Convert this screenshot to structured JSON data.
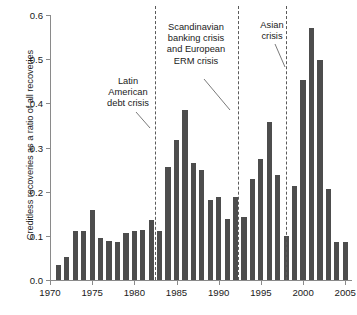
{
  "chart_data": {
    "type": "bar",
    "title": "",
    "xlabel": "",
    "ylabel": "Creditless recoveries as a ratio of all recoveries",
    "xlim": [
      1970,
      2005.8
    ],
    "ylim": [
      0.0,
      0.6
    ],
    "grid": false,
    "legend": null,
    "bar_color": "#4d4d4d",
    "xticks": [
      "1970",
      "1975",
      "1980",
      "1985",
      "1990",
      "1995",
      "2000",
      "2005"
    ],
    "xtick_values": [
      1970,
      1975,
      1980,
      1985,
      1990,
      1995,
      2000,
      2005
    ],
    "yticks": [
      "0.0",
      "0.1",
      "0.2",
      "0.3",
      "0.4",
      "0.5",
      "0.6"
    ],
    "ytick_values": [
      0.0,
      0.1,
      0.2,
      0.3,
      0.4,
      0.5,
      0.6
    ],
    "categories": [
      1971,
      1972,
      1973,
      1974,
      1975,
      1976,
      1977,
      1978,
      1979,
      1980,
      1981,
      1982,
      1983,
      1984,
      1985,
      1986,
      1987,
      1988,
      1989,
      1990,
      1991,
      1992,
      1993,
      1994,
      1995,
      1996,
      1997,
      1998,
      1999,
      2000,
      2001,
      2002,
      2003,
      2004,
      2005
    ],
    "values": [
      0.034,
      0.051,
      0.111,
      0.111,
      0.159,
      0.094,
      0.088,
      0.086,
      0.106,
      0.111,
      0.113,
      0.136,
      0.111,
      0.257,
      0.318,
      0.386,
      0.265,
      0.249,
      0.181,
      0.188,
      0.138,
      0.188,
      0.143,
      0.228,
      0.274,
      0.357,
      0.237,
      0.1,
      0.213,
      0.452,
      0.57,
      0.498,
      0.205,
      0.085,
      0.085
    ],
    "annotations": [
      {
        "id": "latin-american-debt-crisis",
        "lines": [
          "Latin",
          "American",
          "debt crisis"
        ],
        "event_year": 1982.5
      },
      {
        "id": "scandinavian-erm-crisis",
        "lines": [
          "Scandinavian",
          "banking crisis",
          "and European",
          "ERM crisis"
        ],
        "event_year": 1992.3
      },
      {
        "id": "asian-crisis",
        "lines": [
          "Asian",
          "crisis"
        ],
        "event_year": 1998.0
      }
    ],
    "event_lines": [
      1982.5,
      1992.3,
      1998.0
    ]
  }
}
